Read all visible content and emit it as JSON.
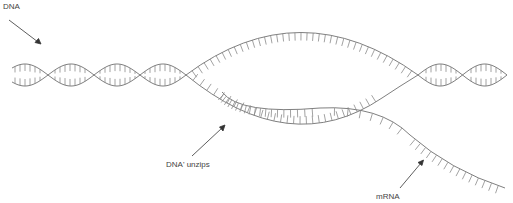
{
  "diagram": {
    "colors": {
      "strand": "#707070",
      "rung": "#8a8a8a",
      "text": "#444444",
      "arrow": "#333333"
    },
    "labels": [
      {
        "id": "dna",
        "text": "DNA",
        "x": 3,
        "y": 2
      },
      {
        "id": "dna-unzips",
        "text": "DNA' unzips",
        "x": 166,
        "y": 160
      },
      {
        "id": "mrna",
        "text": "mRNA",
        "x": 376,
        "y": 192
      }
    ]
  }
}
